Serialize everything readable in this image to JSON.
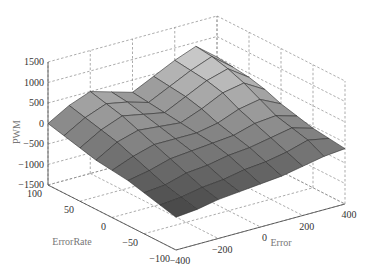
{
  "chart_data": {
    "type": "surface3d",
    "title": "",
    "xlabel": "Error",
    "ylabel": "ErrorRate",
    "zlabel": "PWM",
    "x_ticks": [
      "-400",
      "-200",
      "0",
      "200",
      "400"
    ],
    "y_ticks": [
      "100",
      "50",
      "0",
      "-50",
      "-100"
    ],
    "z_ticks": [
      "1500",
      "1000",
      "500",
      "0",
      "-500",
      "-1000",
      "-1500"
    ],
    "xlim": [
      -400,
      400
    ],
    "ylim": [
      -100,
      100
    ],
    "zlim": [
      -1500,
      1500
    ],
    "grid": true,
    "colormap": "gray",
    "x": [
      -400,
      -300,
      -200,
      -100,
      0,
      100,
      200,
      300,
      400
    ],
    "y": [
      100,
      75,
      50,
      25,
      0,
      -25,
      -50,
      -75,
      -100
    ],
    "z": [
      [
        0,
        300,
        500,
        350,
        200,
        450,
        700,
        900,
        500
      ],
      [
        -100,
        200,
        400,
        300,
        150,
        400,
        650,
        850,
        450
      ],
      [
        -200,
        100,
        300,
        200,
        100,
        350,
        600,
        750,
        400
      ],
      [
        -300,
        0,
        150,
        100,
        50,
        250,
        500,
        600,
        300
      ],
      [
        -350,
        -150,
        0,
        0,
        0,
        100,
        300,
        400,
        150
      ],
      [
        -400,
        -300,
        -150,
        -100,
        -50,
        0,
        150,
        200,
        50
      ],
      [
        -500,
        -450,
        -300,
        -250,
        -150,
        -100,
        0,
        100,
        -50
      ],
      [
        -600,
        -550,
        -450,
        -400,
        -300,
        -250,
        -150,
        0,
        -100
      ],
      [
        -700,
        -650,
        -550,
        -500,
        -450,
        -400,
        -300,
        -200,
        -150
      ]
    ]
  }
}
